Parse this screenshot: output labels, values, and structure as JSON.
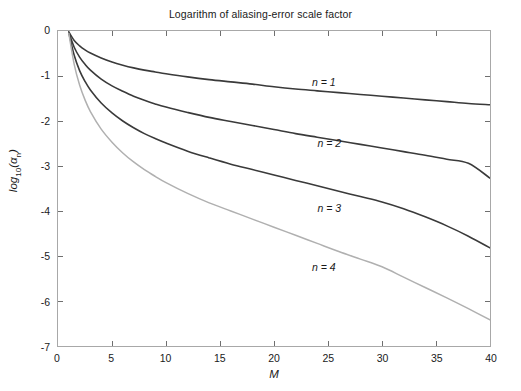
{
  "chart_data": {
    "type": "line",
    "title": "Logarithm of aliasing-error scale factor",
    "xlabel": "M",
    "ylabel": "log10(alpha_n)",
    "ylabel_base": "log",
    "ylabel_sub": "10",
    "ylabel_arg": "(α",
    "ylabel_arg_sub": "n",
    "ylabel_arg_close": ")",
    "xlim": [
      0,
      40
    ],
    "ylim": [
      -7,
      0
    ],
    "xticks": [
      0,
      5,
      10,
      15,
      20,
      25,
      30,
      35,
      40
    ],
    "xtick_labels": [
      "0",
      "5",
      "10",
      "15",
      "20",
      "25",
      "30",
      "35",
      "40"
    ],
    "yticks": [
      0,
      -1,
      -2,
      -3,
      -4,
      -5,
      -6,
      -7
    ],
    "ytick_labels": [
      "0",
      "-1",
      "-2",
      "-3",
      "-4",
      "-5",
      "-6",
      "-7"
    ],
    "grid": false,
    "legend": "inline-annotations",
    "series": [
      {
        "name": "n = 1",
        "color": "#3a3a3a",
        "width": 1.6,
        "label_x": 23.5,
        "label_y": -1.18,
        "x": [
          1,
          1.5,
          2,
          2.5,
          3,
          4,
          5,
          6,
          7,
          8,
          9,
          10,
          12,
          14,
          16,
          18,
          20,
          22,
          24,
          26,
          28,
          30,
          32,
          34,
          36,
          38,
          40
        ],
        "y": [
          -0.02,
          -0.21,
          -0.33,
          -0.42,
          -0.49,
          -0.6,
          -0.69,
          -0.76,
          -0.82,
          -0.87,
          -0.91,
          -0.95,
          -1.02,
          -1.08,
          -1.13,
          -1.18,
          -1.24,
          -1.29,
          -1.33,
          -1.37,
          -1.41,
          -1.45,
          -1.49,
          -1.53,
          -1.57,
          -1.61,
          -1.64
        ]
      },
      {
        "name": "n = 2",
        "color": "#3a3a3a",
        "width": 1.6,
        "label_x": 24.0,
        "label_y": -2.52,
        "x": [
          1,
          1.5,
          2,
          2.5,
          3,
          4,
          5,
          6,
          7,
          8,
          9,
          10,
          12,
          14,
          16,
          18,
          20,
          22,
          24,
          26,
          28,
          30,
          32,
          34,
          36,
          38,
          40
        ],
        "y": [
          -0.03,
          -0.36,
          -0.58,
          -0.74,
          -0.87,
          -1.07,
          -1.22,
          -1.34,
          -1.45,
          -1.54,
          -1.62,
          -1.69,
          -1.81,
          -1.92,
          -2.01,
          -2.1,
          -2.19,
          -2.28,
          -2.36,
          -2.44,
          -2.52,
          -2.6,
          -2.68,
          -2.76,
          -2.85,
          -2.94,
          -3.27
        ]
      },
      {
        "name": "n = 3",
        "color": "#3a3a3a",
        "width": 1.6,
        "label_x": 24.0,
        "label_y": -3.95,
        "x": [
          1,
          1.5,
          2,
          2.5,
          3,
          4,
          5,
          6,
          7,
          8,
          9,
          10,
          12,
          14,
          16,
          18,
          20,
          22,
          24,
          26,
          28,
          30,
          32,
          34,
          36,
          38,
          40
        ],
        "y": [
          -0.04,
          -0.54,
          -0.88,
          -1.12,
          -1.31,
          -1.6,
          -1.82,
          -2.0,
          -2.15,
          -2.28,
          -2.39,
          -2.49,
          -2.67,
          -2.82,
          -2.96,
          -3.08,
          -3.2,
          -3.32,
          -3.44,
          -3.56,
          -3.68,
          -3.8,
          -3.95,
          -4.13,
          -4.33,
          -4.56,
          -4.82
        ]
      },
      {
        "name": "n = 4",
        "color": "#b0b0b0",
        "width": 1.5,
        "label_x": 23.5,
        "label_y": -5.25,
        "x": [
          1,
          1.5,
          2,
          2.5,
          3,
          4,
          5,
          6,
          7,
          8,
          9,
          10,
          12,
          14,
          16,
          18,
          20,
          22,
          24,
          26,
          28,
          30,
          32,
          34,
          36,
          38,
          40
        ],
        "y": [
          -0.05,
          -0.74,
          -1.2,
          -1.53,
          -1.79,
          -2.18,
          -2.47,
          -2.71,
          -2.91,
          -3.08,
          -3.23,
          -3.37,
          -3.61,
          -3.82,
          -4.0,
          -4.18,
          -4.36,
          -4.54,
          -4.72,
          -4.9,
          -5.07,
          -5.24,
          -5.47,
          -5.7,
          -5.93,
          -6.17,
          -6.42
        ]
      }
    ],
    "annotations": [
      {
        "text": "n = 1",
        "x": 23.5,
        "y": -1.18
      },
      {
        "text": "n = 2",
        "x": 24.0,
        "y": -2.52
      },
      {
        "text": "n = 3",
        "x": 24.0,
        "y": -3.95
      },
      {
        "text": "n = 4",
        "x": 23.5,
        "y": -5.25
      }
    ],
    "axis_color": "#a8a8a8",
    "tick_color": "#6e6e6e",
    "text_color": "#1a1a1a",
    "background": "#ffffff"
  }
}
